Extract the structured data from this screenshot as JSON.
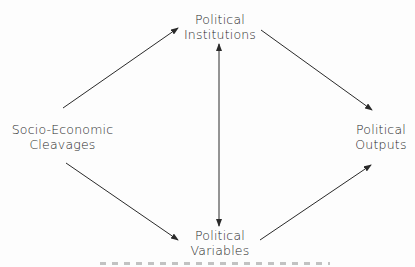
{
  "diagram": {
    "nodes": [
      {
        "id": "socio",
        "line1": "Socio-Economic",
        "line2": "Cleavages"
      },
      {
        "id": "institutions",
        "line1": "Political",
        "line2": "Institutions"
      },
      {
        "id": "variables",
        "line1": "Political",
        "line2": "Variables"
      },
      {
        "id": "outputs",
        "line1": "Political",
        "line2": "Outputs"
      }
    ],
    "edges": [
      {
        "from": "socio",
        "to": "institutions",
        "type": "arrow"
      },
      {
        "from": "socio",
        "to": "variables",
        "type": "arrow"
      },
      {
        "from": "institutions",
        "to": "outputs",
        "type": "arrow"
      },
      {
        "from": "variables",
        "to": "outputs",
        "type": "arrow"
      },
      {
        "from": "institutions",
        "to": "variables",
        "type": "bidirectional"
      }
    ],
    "colors": {
      "ink": "#2a2a2a",
      "background": "#fdfdfd"
    }
  }
}
